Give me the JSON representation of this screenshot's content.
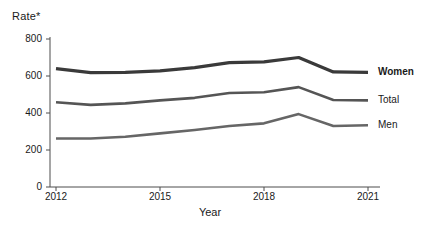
{
  "chart_data": {
    "type": "line",
    "title": "",
    "ylabel": "Rate*",
    "xlabel": "Year",
    "x": [
      2012,
      2013,
      2014,
      2015,
      2016,
      2017,
      2018,
      2019,
      2020,
      2021
    ],
    "xlim": [
      2012,
      2021
    ],
    "ylim": [
      0,
      800
    ],
    "yticks": [
      0,
      200,
      400,
      600,
      800
    ],
    "xticks": [
      2012,
      2015,
      2018,
      2021
    ],
    "xtick_labels": [
      "2012",
      "2015",
      "2018",
      "2021"
    ],
    "ytick_labels": [
      "0",
      "200",
      "400",
      "600",
      "800"
    ],
    "grid": false,
    "legend_position": "right-inline",
    "series": [
      {
        "name": "Women",
        "color": "#3a3a3a",
        "width": 3.2,
        "values": [
          640,
          618,
          620,
          628,
          645,
          672,
          676,
          700,
          622,
          620
        ]
      },
      {
        "name": "Total",
        "color": "#555555",
        "width": 2.6,
        "values": [
          458,
          444,
          452,
          468,
          482,
          508,
          512,
          540,
          470,
          468
        ]
      },
      {
        "name": "Men",
        "color": "#666666",
        "width": 2.6,
        "values": [
          262,
          262,
          272,
          290,
          308,
          330,
          344,
          394,
          330,
          334
        ]
      }
    ]
  },
  "axis": {
    "y_title": "Rate*",
    "x_title": "Year"
  },
  "legend": {
    "women": "Women",
    "total": "Total",
    "men": "Men"
  }
}
